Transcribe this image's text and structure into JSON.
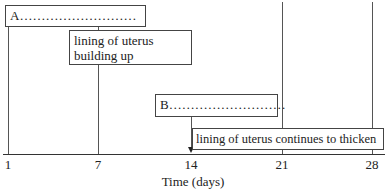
{
  "diagram": {
    "boxes": {
      "a": "A………………………",
      "building": [
        "lining of uterus",
        "building up"
      ],
      "b": "B………………………",
      "thicken": "lining of uterus continues to thicken"
    },
    "axis": {
      "ticks": [
        "1",
        "7",
        "14",
        "21",
        "28"
      ],
      "label": "Time (days)"
    }
  }
}
